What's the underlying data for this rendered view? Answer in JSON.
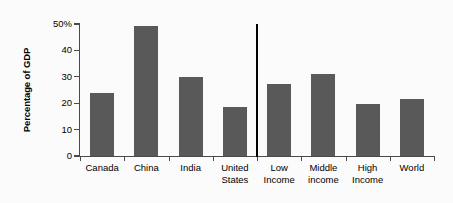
{
  "chart_data": {
    "type": "bar",
    "title": "",
    "xlabel": "",
    "ylabel": "Percentage of GDP",
    "categories": [
      "Canada",
      "China",
      "India",
      "United States",
      "Low Income",
      "Middle income",
      "High Income",
      "World"
    ],
    "category_lines": [
      [
        "Canada"
      ],
      [
        "China"
      ],
      [
        "India"
      ],
      [
        "United",
        "States"
      ],
      [
        "Low",
        "Income"
      ],
      [
        "Middle",
        "income"
      ],
      [
        "High",
        "Income"
      ],
      [
        "World"
      ]
    ],
    "values": [
      24.0,
      49.2,
      30.0,
      18.6,
      27.3,
      31.0,
      19.7,
      21.6
    ],
    "ylim": [
      0,
      50
    ],
    "yticks": [
      0,
      10,
      20,
      30,
      40,
      50
    ],
    "ytick_labels": [
      "0",
      "10",
      "20",
      "30",
      "40",
      "50%"
    ],
    "grid": false,
    "legend": "none",
    "annotations": [
      {
        "name": "group-divider",
        "description": "vertical separator between country bars and income-group bars",
        "after_category": "United States"
      }
    ],
    "colors": {
      "bar": "#595959",
      "axis": "#4a4a4a",
      "divider": "#000000",
      "background": "#fbfbfb",
      "text": "#000000"
    }
  }
}
